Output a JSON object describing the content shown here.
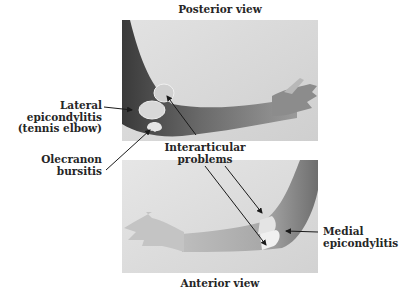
{
  "figure": {
    "top_title": "Posterior view",
    "bottom_title": "Anterior view",
    "labels": {
      "lateral_epicondylitis": [
        "Lateral",
        "epicondylitis",
        "(tennis elbow)"
      ],
      "olecranon_bursitis": [
        "Olecranon",
        "bursitis"
      ],
      "interarticular_problems": [
        "Interarticular",
        "problems"
      ],
      "medial_epicondylitis": [
        "Medial",
        "epicondylitis"
      ]
    }
  }
}
